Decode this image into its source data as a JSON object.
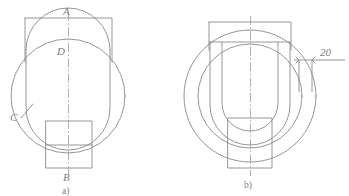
{
  "figure": {
    "background_color": "#ffffff",
    "line_color": "#8a8a8a",
    "text_color": "#7d7d7d",
    "centerline_color": "#9a9a9a"
  },
  "view_a": {
    "caption": "a)",
    "labels": {
      "top": "A",
      "inner_top": "D",
      "left": "C",
      "bottom": "B"
    }
  },
  "view_b": {
    "caption": "b)",
    "dimension": {
      "value": "20"
    }
  }
}
